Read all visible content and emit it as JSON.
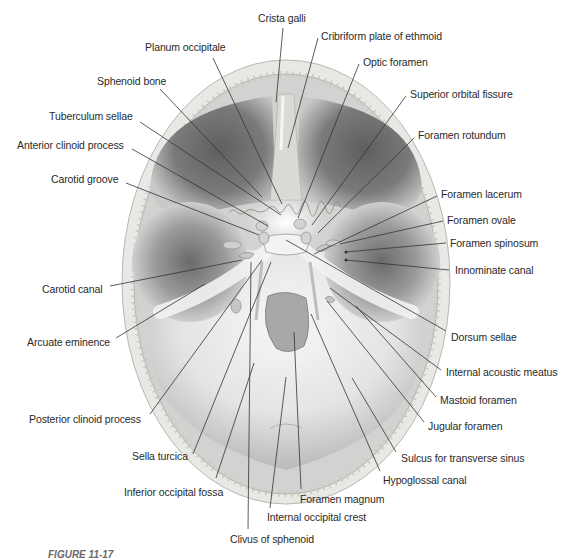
{
  "figure": {
    "caption_visible": "FIGURE 11-17",
    "colors": {
      "background": "#ffffff",
      "bone_rim": "#e9e9e6",
      "bone_rim_edge": "#bdbdb8",
      "fossa_dark": "#6e6e6e",
      "fossa_mid": "#a6a6a6",
      "fossa_light": "#e6e6e6",
      "leader_line": "#333333",
      "label_text": "#2a2a2a"
    }
  },
  "labels": [
    {
      "id": "crista-galli",
      "text": "Crista galli",
      "x": 258,
      "y": 12,
      "lx1": 283,
      "ly1": 28,
      "lx2": 276,
      "ly2": 102
    },
    {
      "id": "cribriform-plate",
      "text": "Cribriform plate of ethmoid",
      "x": 321,
      "y": 30,
      "lx1": 318,
      "ly1": 38,
      "lx2": 288,
      "ly2": 148
    },
    {
      "id": "planum-occipitale",
      "text": "Planum occipitale",
      "x": 145,
      "y": 41,
      "lx1": 213,
      "ly1": 58,
      "lx2": 282,
      "ly2": 204
    },
    {
      "id": "optic-foramen",
      "text": "Optic foramen",
      "x": 363,
      "y": 56,
      "lx1": 359,
      "ly1": 64,
      "lx2": 298,
      "ly2": 218
    },
    {
      "id": "sphenoid-bone",
      "text": "Sphenoid bone",
      "x": 97,
      "y": 75,
      "lx1": 160,
      "ly1": 89,
      "lx2": 262,
      "ly2": 197
    },
    {
      "id": "superior-orbital-fissure",
      "text": "Superior orbital fissure",
      "x": 410,
      "y": 88,
      "lx1": 406,
      "ly1": 96,
      "lx2": 312,
      "ly2": 225
    },
    {
      "id": "tuberculum-sellae",
      "text": "Tuberculum sellae",
      "x": 49,
      "y": 110,
      "lx1": 140,
      "ly1": 122,
      "lx2": 281,
      "ly2": 215
    },
    {
      "id": "foramen-rotundum",
      "text": "Foramen rotundum",
      "x": 418,
      "y": 129,
      "lx1": 414,
      "ly1": 138,
      "lx2": 318,
      "ly2": 233
    },
    {
      "id": "anterior-clinoid-process",
      "text": "Anterior clinoid process",
      "x": 17,
      "y": 139,
      "lx1": 132,
      "ly1": 149,
      "lx2": 268,
      "ly2": 226
    },
    {
      "id": "carotid-groove",
      "text": "Carotid groove",
      "x": 51,
      "y": 173,
      "lx1": 126,
      "ly1": 183,
      "lx2": 259,
      "ly2": 235
    },
    {
      "id": "foramen-lacerum",
      "text": "Foramen lacerum",
      "x": 441,
      "y": 188,
      "lx1": 437,
      "ly1": 196,
      "lx2": 314,
      "ly2": 254
    },
    {
      "id": "foramen-ovale",
      "text": "Foramen ovale",
      "x": 447,
      "y": 214,
      "lx1": 443,
      "ly1": 221,
      "lx2": 340,
      "ly2": 244
    },
    {
      "id": "foramen-spinosum",
      "text": "Foramen spinosum",
      "x": 450,
      "y": 237,
      "lx1": 446,
      "ly1": 243,
      "lx2": 346,
      "ly2": 252
    },
    {
      "id": "innominate-canal",
      "text": "Innominate canal",
      "x": 455,
      "y": 264,
      "lx1": 449,
      "ly1": 270,
      "lx2": 346,
      "ly2": 260
    },
    {
      "id": "carotid-canal",
      "text": "Carotid canal",
      "x": 42,
      "y": 283,
      "lx1": 110,
      "ly1": 286,
      "lx2": 242,
      "ly2": 260
    },
    {
      "id": "arcuate-eminence",
      "text": "Arcuate eminence",
      "x": 27,
      "y": 336,
      "lx1": 116,
      "ly1": 338,
      "lx2": 205,
      "ly2": 284
    },
    {
      "id": "dorsum-sellae",
      "text": "Dorsum sellae",
      "x": 451,
      "y": 331,
      "lx1": 446,
      "ly1": 331,
      "lx2": 286,
      "ly2": 240
    },
    {
      "id": "internal-acoustic-meatus",
      "text": "Internal acoustic meatus",
      "x": 446,
      "y": 366,
      "lx1": 441,
      "ly1": 370,
      "lx2": 330,
      "ly2": 288
    },
    {
      "id": "mastoid-foramen",
      "text": "Mastoid foramen",
      "x": 440,
      "y": 394,
      "lx1": 436,
      "ly1": 397,
      "lx2": 356,
      "ly2": 306
    },
    {
      "id": "posterior-clinoid-process",
      "text": "Posterior clinoid process",
      "x": 29,
      "y": 413,
      "lx1": 150,
      "ly1": 414,
      "lx2": 262,
      "ly2": 260
    },
    {
      "id": "jugular-foramen",
      "text": "Jugular foramen",
      "x": 428,
      "y": 420,
      "lx1": 424,
      "ly1": 422,
      "lx2": 327,
      "ly2": 301
    },
    {
      "id": "sulcus-transverse-sinus",
      "text": "Sulcus for transverse sinus",
      "x": 401,
      "y": 452,
      "lx1": 396,
      "ly1": 452,
      "lx2": 352,
      "ly2": 378
    },
    {
      "id": "sella-turcica",
      "text": "Sella turcica",
      "x": 132,
      "y": 450,
      "lx1": 193,
      "ly1": 454,
      "lx2": 271,
      "ly2": 262
    },
    {
      "id": "hypoglossal-canal",
      "text": "Hypoglossal canal",
      "x": 383,
      "y": 474,
      "lx1": 380,
      "ly1": 471,
      "lx2": 311,
      "ly2": 314
    },
    {
      "id": "inferior-occipital-fossa",
      "text": "Inferior occipital fossa",
      "x": 124,
      "y": 486,
      "lx1": 216,
      "ly1": 478,
      "lx2": 254,
      "ly2": 363
    },
    {
      "id": "foramen-magnum",
      "text": "Foramen magnum",
      "x": 300,
      "y": 493,
      "lx1": 301,
      "ly1": 489,
      "lx2": 294,
      "ly2": 332
    },
    {
      "id": "internal-occipital-crest",
      "text": "Internal occipital crest",
      "x": 267,
      "y": 511,
      "lx1": 270,
      "ly1": 508,
      "lx2": 286,
      "ly2": 377
    },
    {
      "id": "clivus-of-sphenoid",
      "text": "Clivus of sphenoid",
      "x": 230,
      "y": 533,
      "lx1": 248,
      "ly1": 529,
      "lx2": 251,
      "ly2": 262
    }
  ]
}
